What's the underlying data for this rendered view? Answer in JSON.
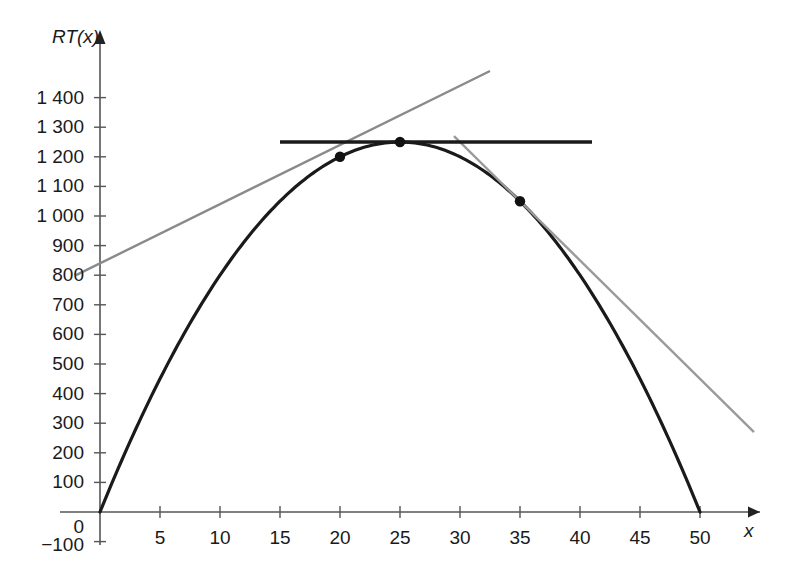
{
  "chart_data": {
    "type": "line",
    "title": "",
    "xlabel": "x",
    "ylabel": "RT(x)",
    "xlim": [
      -3,
      55
    ],
    "ylim": [
      -120,
      1480
    ],
    "grid": false,
    "legend": null,
    "x_ticks": [
      {
        "value": 5,
        "label": "5"
      },
      {
        "value": 10,
        "label": "10"
      },
      {
        "value": 15,
        "label": "15"
      },
      {
        "value": 20,
        "label": "20"
      },
      {
        "value": 25,
        "label": "25"
      },
      {
        "value": 30,
        "label": "30"
      },
      {
        "value": 35,
        "label": "35"
      },
      {
        "value": 40,
        "label": "40"
      },
      {
        "value": 45,
        "label": "45"
      },
      {
        "value": 50,
        "label": "50"
      }
    ],
    "y_ticks": [
      {
        "value": 1400,
        "label": "1 400"
      },
      {
        "value": 1300,
        "label": "1 300"
      },
      {
        "value": 1200,
        "label": "1 200"
      },
      {
        "value": 1100,
        "label": "1 100"
      },
      {
        "value": 1000,
        "label": "1 000"
      },
      {
        "value": 900,
        "label": "900"
      },
      {
        "value": 800,
        "label": "800"
      },
      {
        "value": 700,
        "label": "700"
      },
      {
        "value": 600,
        "label": "600"
      },
      {
        "value": 500,
        "label": "500"
      },
      {
        "value": 400,
        "label": "400"
      },
      {
        "value": 300,
        "label": "300"
      },
      {
        "value": 200,
        "label": "200"
      },
      {
        "value": 100,
        "label": "100"
      },
      {
        "value": 0,
        "label": "0"
      },
      {
        "value": -100,
        "label": "−100"
      }
    ],
    "series": [
      {
        "name": "RT(x) parabola",
        "type": "curve",
        "color": "#1a1a1a",
        "formula": "RT(x) = -2x^2 + 100x",
        "x_start": 0,
        "x_end": 50,
        "vertex": {
          "x": 25,
          "y": 1250
        },
        "roots": [
          0,
          50
        ]
      },
      {
        "name": "tangent at x=20",
        "type": "line",
        "color": "#8a8a8a",
        "slope": 20,
        "intercept": 840,
        "x_start": -2,
        "x_end": 32.5,
        "tangent_point": {
          "x": 20,
          "y": 1200
        }
      },
      {
        "name": "tangent at x=35",
        "type": "line",
        "color": "#9a9a9a",
        "slope": -40,
        "intercept": 2450,
        "x_start": 29.5,
        "x_end": 54.5,
        "tangent_point": {
          "x": 35,
          "y": 1050
        }
      },
      {
        "name": "tangent at vertex x=25",
        "type": "line",
        "color": "#1a1a1a",
        "slope": 0,
        "intercept": 1250,
        "x_start": 15,
        "x_end": 41,
        "tangent_point": {
          "x": 25,
          "y": 1250
        }
      }
    ],
    "points": [
      {
        "x": 20,
        "y": 1200,
        "label": ""
      },
      {
        "x": 25,
        "y": 1250,
        "label": ""
      },
      {
        "x": 35,
        "y": 1050,
        "label": ""
      }
    ]
  }
}
